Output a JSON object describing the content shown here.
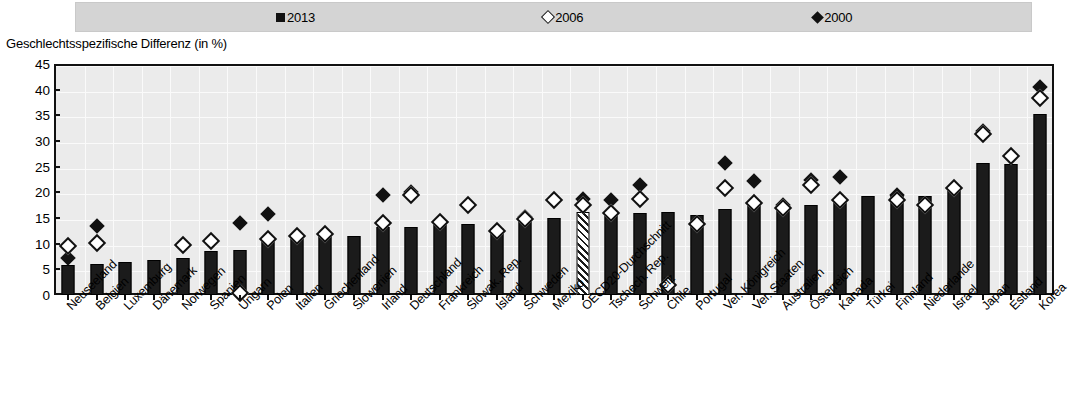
{
  "legend": {
    "items": [
      {
        "label": "2013",
        "marker": "filled-square-icon"
      },
      {
        "label": "2006",
        "marker": "open-diamond-icon"
      },
      {
        "label": "2000",
        "marker": "filled-diamond-icon"
      }
    ]
  },
  "axis_title": "Geschlechtsspezifische Differenz (in %)",
  "chart_data": {
    "type": "bar",
    "title": "",
    "subtitle": "",
    "xlabel": "",
    "ylabel": "Geschlechtsspezifische Differenz (in %)",
    "ylim": [
      0,
      45
    ],
    "yticks": [
      0,
      5,
      10,
      15,
      20,
      25,
      30,
      35,
      40,
      45
    ],
    "grid": true,
    "legend_position": "top",
    "categories": [
      "Neuseeland",
      "Belgien",
      "Luxemburg",
      "Dänemark",
      "Norwegen",
      "Spanien",
      "Ungarn",
      "Polen",
      "Italien",
      "Griechenland",
      "Slowenien",
      "Irland",
      "Deutschland",
      "Frankreich",
      "Slowak. Rep.",
      "Island",
      "Schweden",
      "Mexiko",
      "OECD20-Durchschnitt",
      "Tschech. Rep.",
      "Schweiz",
      "Chile",
      "Portugal",
      "Ver. Königreich",
      "Ver. Staaten",
      "Australien",
      "Österreich",
      "Kanada",
      "Türkei",
      "Finnland",
      "Niederlande",
      "Israel",
      "Japan",
      "Estland",
      "Korea"
    ],
    "highlight_category": "OECD20-Durchschnitt",
    "series": [
      {
        "name": "2013",
        "marker": "bar",
        "values": [
          5.8,
          6.0,
          6.5,
          6.8,
          7.2,
          8.6,
          8.8,
          10.8,
          11.0,
          11.5,
          11.5,
          13.2,
          13.2,
          14.5,
          13.8,
          13.0,
          14.8,
          15.0,
          16.2,
          15.8,
          16.0,
          16.2,
          15.5,
          16.8,
          17.8,
          17.0,
          17.5,
          18.5,
          19.2,
          19.5,
          19.3,
          20.8,
          25.7,
          25.5,
          35.2
        ]
      },
      {
        "name": "2006",
        "marker": "open-diamond",
        "values": [
          9.5,
          10.2,
          null,
          null,
          9.8,
          10.5,
          0.3,
          11.0,
          11.5,
          11.8,
          null,
          14.0,
          19.5,
          14.2,
          17.5,
          12.5,
          14.8,
          18.5,
          17.5,
          16.0,
          18.8,
          2.0,
          13.8,
          20.8,
          18.0,
          17.0,
          21.5,
          18.5,
          null,
          18.5,
          17.5,
          20.8,
          31.3,
          27.0,
          38.3
        ]
      },
      {
        "name": "2000",
        "marker": "filled-diamond",
        "values": [
          7.2,
          13.5,
          null,
          null,
          10.0,
          null,
          14.0,
          15.8,
          null,
          null,
          null,
          19.5,
          20.0,
          null,
          null,
          null,
          15.2,
          null,
          18.8,
          18.5,
          21.5,
          null,
          null,
          25.8,
          22.3,
          17.5,
          22.5,
          23.0,
          null,
          19.5,
          null,
          null,
          32.0,
          null,
          40.5
        ]
      }
    ]
  }
}
